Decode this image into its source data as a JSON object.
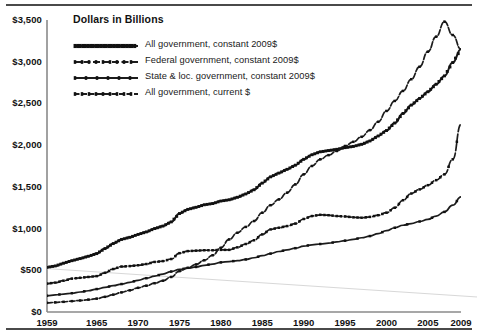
{
  "chart_data": {
    "type": "line",
    "title": "Dollars in Billions",
    "xlabel": "",
    "ylabel": "",
    "grid": false,
    "legend_position": "top-left",
    "xlim": [
      1959,
      2009
    ],
    "ylim": [
      0,
      3500
    ],
    "yticks": [
      0,
      500,
      1000,
      1500,
      2000,
      2500,
      3000,
      3500
    ],
    "ytick_labels": [
      "$0",
      "$500",
      "$1,000",
      "$1,500",
      "$2,000",
      "$2,500",
      "$3,000",
      "$3,500"
    ],
    "xticks": [
      1959,
      1965,
      1970,
      1975,
      1980,
      1985,
      1990,
      1995,
      2000,
      2005,
      2009
    ],
    "xtick_labels": [
      "1959",
      "1965",
      "1970",
      "1975",
      "1980",
      "1985",
      "1990",
      "1995",
      "2000",
      "2005",
      "2009"
    ],
    "x": [
      1959,
      1960,
      1961,
      1962,
      1963,
      1964,
      1965,
      1966,
      1967,
      1968,
      1969,
      1970,
      1971,
      1972,
      1973,
      1974,
      1975,
      1976,
      1977,
      1978,
      1979,
      1980,
      1981,
      1982,
      1983,
      1984,
      1985,
      1986,
      1987,
      1988,
      1989,
      1990,
      1991,
      1992,
      1993,
      1994,
      1995,
      1996,
      1997,
      1998,
      1999,
      2000,
      2001,
      2002,
      2003,
      2004,
      2005,
      2006,
      2007,
      2008,
      2009
    ],
    "series": [
      {
        "name": "All government, constant 2009$",
        "style": "dense-dotted",
        "values": [
          535,
          552,
          585,
          615,
          640,
          668,
          700,
          760,
          820,
          870,
          895,
          930,
          960,
          1000,
          1030,
          1080,
          1180,
          1230,
          1255,
          1285,
          1300,
          1330,
          1345,
          1375,
          1415,
          1465,
          1545,
          1620,
          1665,
          1710,
          1760,
          1830,
          1885,
          1920,
          1935,
          1950,
          1970,
          1985,
          2010,
          2050,
          2110,
          2175,
          2265,
          2380,
          2480,
          2560,
          2640,
          2730,
          2830,
          2990,
          3150
        ]
      },
      {
        "name": "Federal government, constant 2009$",
        "style": "dash-marker",
        "values": [
          340,
          352,
          375,
          400,
          410,
          420,
          430,
          470,
          515,
          545,
          550,
          560,
          575,
          600,
          610,
          635,
          705,
          730,
          735,
          740,
          740,
          745,
          745,
          775,
          815,
          860,
          930,
          990,
          1010,
          1030,
          1060,
          1115,
          1150,
          1165,
          1160,
          1150,
          1145,
          1135,
          1130,
          1140,
          1160,
          1190,
          1250,
          1340,
          1420,
          1470,
          1520,
          1580,
          1650,
          1830,
          2250
        ]
      },
      {
        "name": "State & loc. government, constant 2009$",
        "style": "sparse-marker",
        "values": [
          195,
          205,
          215,
          225,
          240,
          255,
          275,
          295,
          315,
          335,
          355,
          380,
          405,
          430,
          455,
          485,
          510,
          525,
          540,
          560,
          575,
          595,
          605,
          615,
          630,
          650,
          675,
          700,
          725,
          745,
          765,
          790,
          805,
          815,
          825,
          840,
          855,
          870,
          890,
          910,
          940,
          975,
          1010,
          1040,
          1060,
          1085,
          1110,
          1150,
          1200,
          1280,
          1380
        ]
      },
      {
        "name": "All government, current $",
        "style": "medium-dash",
        "values": [
          110,
          115,
          122,
          130,
          138,
          148,
          160,
          182,
          208,
          235,
          260,
          290,
          315,
          345,
          375,
          420,
          490,
          530,
          570,
          620,
          680,
          770,
          870,
          950,
          1020,
          1090,
          1190,
          1280,
          1350,
          1430,
          1530,
          1650,
          1750,
          1830,
          1880,
          1930,
          1990,
          2040,
          2100,
          2180,
          2280,
          2410,
          2530,
          2650,
          2790,
          2940,
          3120,
          3300,
          3480,
          3320,
          3150
        ]
      }
    ],
    "artifact_line": {
      "description": "faint scan artifact diagonal",
      "from": [
        1959,
        520
      ],
      "to": [
        2009,
        180
      ]
    }
  }
}
